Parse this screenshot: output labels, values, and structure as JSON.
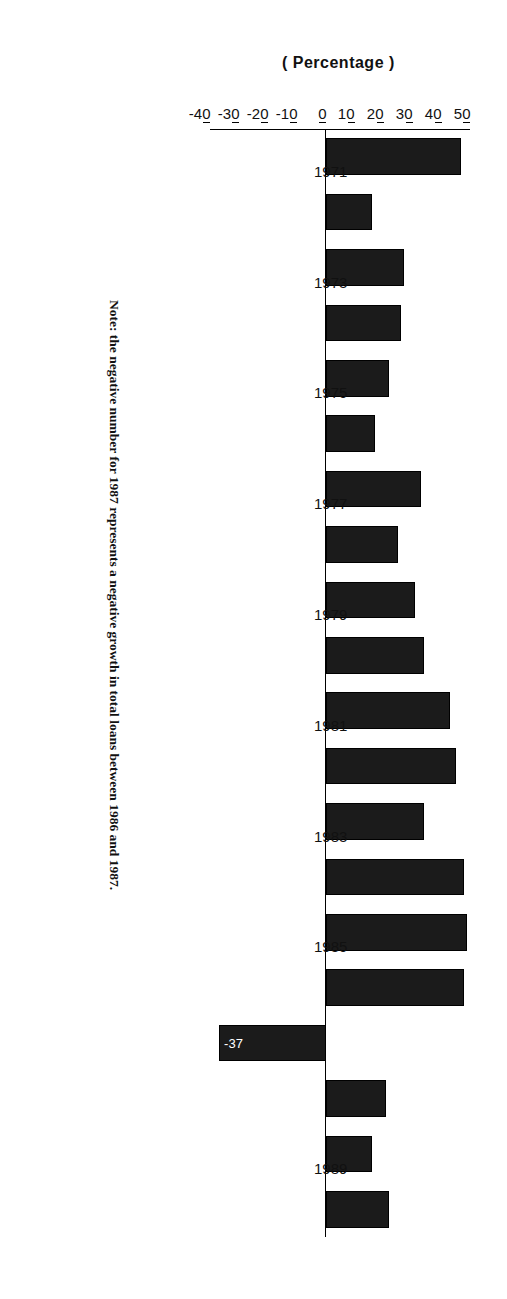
{
  "figure": {
    "y_axis_title": "( Percentage )",
    "note": "Note: the negative number for 1987 represents a negative growth in total loans between 1986 and 1987.",
    "negative_bar_label": "-37",
    "bar_color": "#1b1b1b",
    "axis_color": "#000000",
    "background": "#ffffff"
  },
  "chart_data": {
    "type": "bar",
    "title": "",
    "xlabel": "",
    "ylabel": "( Percentage )",
    "orientation": "vertical-rotated-90",
    "grid": false,
    "legend": null,
    "ylim": [
      -40,
      50
    ],
    "ytick_values": [
      50,
      40,
      30,
      20,
      10,
      0,
      -10,
      -20,
      -30,
      -40
    ],
    "ytick_labels": [
      "50",
      "40",
      "30",
      "20",
      "10",
      "0",
      "-10",
      "-20",
      "-30",
      "-40"
    ],
    "xtick_labels": [
      "1971",
      "1973",
      "1975",
      "1977",
      "1979",
      "1981",
      "1983",
      "1985",
      "1989"
    ],
    "categories": [
      "1971",
      "1972",
      "1973",
      "1974",
      "1975",
      "1976",
      "1977",
      "1978",
      "1979",
      "1980",
      "1981",
      "1982",
      "1983",
      "1984",
      "1985",
      "1986",
      "1987",
      "1988",
      "1989",
      "1990"
    ],
    "values": [
      47,
      16,
      27,
      26,
      22,
      17,
      33,
      25,
      31,
      34,
      43,
      45,
      34,
      48,
      49,
      48,
      -37,
      21,
      16,
      22
    ],
    "annotations": [
      {
        "category": "1987",
        "text": "-37"
      }
    ]
  }
}
